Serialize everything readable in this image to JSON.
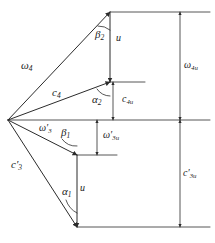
{
  "figure": {
    "kind": "velocity-triangle-diagram",
    "title": "",
    "stroke_color": "#2b2b2b",
    "text_color": "#1a1a1a",
    "background": "#ffffff"
  },
  "labels": {
    "omega4": {
      "base": "ω",
      "sub": "4",
      "prime": "",
      "text": "ω₄",
      "x": 22,
      "y": 61
    },
    "c4": {
      "base": "c",
      "sub": "4",
      "prime": "",
      "text": "c₄",
      "x": 53,
      "y": 88
    },
    "beta2": {
      "base": "β",
      "sub": "2",
      "prime": "",
      "text": "β₂",
      "x": 96,
      "y": 30
    },
    "u_top": {
      "base": "u",
      "sub": "",
      "prime": "",
      "text": "u",
      "x": 116,
      "y": 33
    },
    "alpha2": {
      "base": "α",
      "sub": "2",
      "prime": "",
      "text": "α₂",
      "x": 93,
      "y": 95
    },
    "c4u": {
      "base": "c",
      "sub": "4u",
      "prime": "",
      "text": "c₄ᵤ",
      "x": 123,
      "y": 95
    },
    "omega4u": {
      "base": "ω",
      "sub": "4u",
      "prime": "",
      "text": "ω₄ᵤ",
      "x": 185,
      "y": 61
    },
    "omega3prime": {
      "base": "ω",
      "sub": "3",
      "prime": "′",
      "text": "ω′₃",
      "x": 40,
      "y": 124
    },
    "beta1": {
      "base": "β",
      "sub": "1",
      "prime": "",
      "text": "β₁",
      "x": 62,
      "y": 128
    },
    "omega3u_prime": {
      "base": "ω",
      "sub": "3u",
      "prime": "′",
      "text": "ω′₃ᵤ",
      "x": 104,
      "y": 131
    },
    "c3prime": {
      "base": "c",
      "sub": "3",
      "prime": "′",
      "text": "c′₃",
      "x": 12,
      "y": 160
    },
    "alpha1": {
      "base": "α",
      "sub": "1",
      "prime": "",
      "text": "α₁",
      "x": 63,
      "y": 187
    },
    "u_bottom": {
      "base": "u",
      "sub": "",
      "prime": "",
      "text": "u",
      "x": 80,
      "y": 183
    },
    "c3u_prime": {
      "base": "c",
      "sub": "3u",
      "prime": "′",
      "text": "c′₃ᵤ",
      "x": 184,
      "y": 169
    }
  },
  "geometry": {
    "apex": {
      "x": 8,
      "y": 120
    },
    "top_vertex": {
      "x": 110,
      "y": 12
    },
    "mid_vertex": {
      "x": 110,
      "y": 82
    },
    "low_vertex": {
      "x": 77,
      "y": 155
    },
    "bottom_vertex": {
      "x": 77,
      "y": 227
    },
    "axis_line_y": 120,
    "axis_line_x2": 210,
    "right_dim_x": 180,
    "inner_dim_x_top": 113,
    "inner_dim_x_bottom": 97
  }
}
